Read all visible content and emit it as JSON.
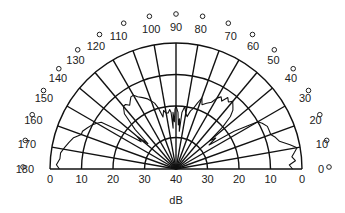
{
  "chart_data": {
    "type": "polar",
    "title": "",
    "radial_axis": {
      "label": "dB",
      "tick_labels_left": [
        "0",
        "10",
        "20",
        "30",
        "40"
      ],
      "tick_labels_right": [
        "40",
        "30",
        "20",
        "10",
        "0"
      ],
      "center_value": 40,
      "outer_value": 0,
      "ring_values": [
        0,
        10,
        20,
        30
      ]
    },
    "angular_axis": {
      "range_deg": [
        0,
        180
      ],
      "step_deg": 10,
      "tick_labels": [
        "0",
        "10",
        "20",
        "30",
        "40",
        "50",
        "60",
        "70",
        "80",
        "90",
        "100",
        "110",
        "120",
        "130",
        "140",
        "150",
        "160",
        "170",
        "180"
      ],
      "unit_symbol": "o"
    },
    "grid": true,
    "series": [
      {
        "name": "radiation pattern",
        "angles_deg": [
          0,
          2,
          4,
          6,
          8,
          10,
          12,
          15,
          18,
          20,
          22,
          25,
          28,
          30,
          33,
          36,
          38,
          40,
          42,
          44,
          46,
          48,
          50,
          52,
          54,
          56,
          58,
          60,
          62,
          65,
          68,
          70,
          72,
          74,
          76,
          78,
          80,
          82,
          84,
          85,
          86,
          87,
          88,
          89,
          90,
          91,
          92,
          93,
          94,
          95,
          96,
          98,
          100,
          102,
          104,
          106,
          108,
          110,
          112,
          115,
          118,
          120,
          122,
          124,
          126,
          128,
          130,
          133,
          136,
          138,
          140,
          142,
          145,
          148,
          150,
          152,
          155,
          158,
          160,
          163,
          166,
          169,
          172,
          175,
          178,
          180
        ],
        "attenuation_db": [
          3,
          4,
          2,
          3,
          2,
          1,
          3,
          6,
          7,
          8,
          8,
          8,
          9,
          10,
          18,
          27,
          24,
          26,
          20,
          16,
          14,
          13,
          12,
          13,
          12,
          14,
          13,
          14,
          16,
          17,
          18,
          16,
          18,
          20,
          21,
          23,
          22,
          20,
          22,
          28,
          24,
          26,
          22,
          21,
          20,
          21,
          25,
          22,
          27,
          22,
          21,
          22,
          22,
          21,
          23,
          20,
          18,
          17,
          16,
          15,
          14,
          13,
          13,
          14,
          15,
          14,
          14,
          16,
          22,
          28,
          24,
          26,
          20,
          12,
          11,
          10,
          9,
          8,
          8,
          6,
          5,
          4,
          3,
          3,
          2,
          3
        ]
      }
    ]
  },
  "labels": {
    "axis_title": "dB"
  }
}
